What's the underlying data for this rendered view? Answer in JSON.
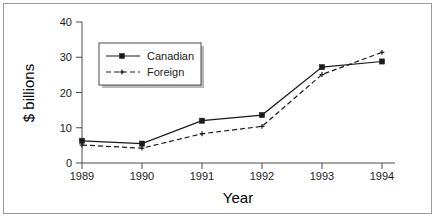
{
  "chart_data": {
    "type": "line",
    "title": "",
    "xlabel": "Year",
    "ylabel": "$ billions",
    "categories": [
      "1989",
      "1990",
      "1991",
      "1992",
      "1993",
      "1994"
    ],
    "x": [
      1989,
      1990,
      1991,
      1992,
      1993,
      1994
    ],
    "series": [
      {
        "name": "Canadian",
        "values": [
          6.3,
          5.5,
          12.0,
          13.6,
          27.2,
          28.8
        ],
        "style": "solid",
        "marker": "filled-square",
        "color": "#1a1a1a"
      },
      {
        "name": "Foreign",
        "values": [
          5.1,
          4.2,
          8.3,
          10.4,
          25.1,
          31.4
        ],
        "style": "dashed",
        "marker": "small-cross",
        "color": "#1a1a1a"
      }
    ],
    "xlim": [
      1988.75,
      1994.25
    ],
    "ylim": [
      0,
      40
    ],
    "yticks": [
      0,
      10,
      20,
      30,
      40
    ],
    "ytick_labels": [
      "0",
      "10",
      "20",
      "30",
      "40"
    ],
    "xticks": [
      1989,
      1990,
      1991,
      1992,
      1993,
      1994
    ],
    "xtick_labels": [
      "1989",
      "1990",
      "1991",
      "1992",
      "1993",
      "1994"
    ],
    "grid": false,
    "legend_position": "upper-left-inside",
    "legend_entries": [
      "Canadian",
      "Foreign"
    ]
  },
  "axes": {
    "y_title": "$ billions",
    "x_title": "Year",
    "y_ticks": [
      "40",
      "30",
      "20",
      "10",
      "0"
    ],
    "x_ticks": [
      "1989",
      "1990",
      "1991",
      "1992",
      "1993",
      "1994"
    ]
  },
  "legend": {
    "items": [
      {
        "label": "Canadian"
      },
      {
        "label": "Foreign"
      }
    ]
  },
  "colors": {
    "background": "#ffffff",
    "border": "#9a9a9a",
    "axis": "#4a4a4a",
    "ink": "#1a1a1a",
    "legend_shadow": "#b8b8b8"
  }
}
